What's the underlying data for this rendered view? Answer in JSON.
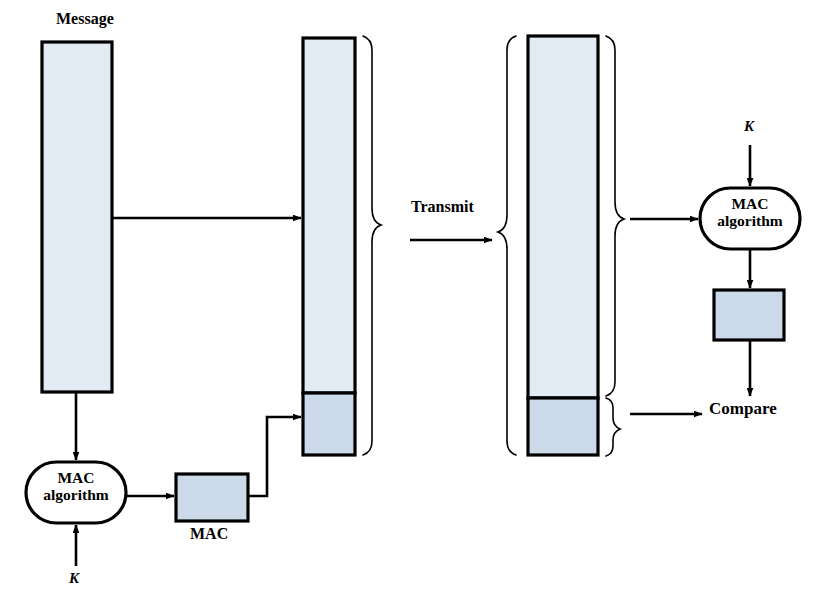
{
  "figure": {
    "title_text": "Message Authentication Code (MAC) diagram",
    "colors": {
      "message_fill": "#e3ecf4",
      "mac_fill": "#ccd9e8",
      "stroke": "#000000",
      "background": "#ffffff"
    }
  },
  "labels": {
    "message": "Message",
    "transmit": "Transmit",
    "compare": "Compare",
    "mac": "MAC",
    "key_left": "K",
    "key_right": "K"
  },
  "nodes": {
    "mac_algorithm_left": {
      "line1": "MAC",
      "line2": "algorithm"
    },
    "mac_algorithm_right": {
      "line1": "MAC",
      "line2": "algorithm"
    }
  },
  "blocks": {
    "source_message": {
      "label": "Message"
    },
    "transmitted": {
      "message_part": "Message",
      "mac_part": "MAC"
    },
    "received": {
      "message_part": "Message",
      "mac_part": "MAC"
    },
    "computed_mac": {
      "label": "MAC"
    },
    "mac_value": {
      "label": "MAC"
    }
  },
  "flow": {
    "steps": [
      "Message is fed to MAC algorithm with key K",
      "MAC algorithm produces MAC",
      "Message and MAC are concatenated and transmitted",
      "Receiver splits message and MAC",
      "Receiver recomputes MAC from message with key K",
      "Compare received MAC with computed MAC"
    ]
  }
}
